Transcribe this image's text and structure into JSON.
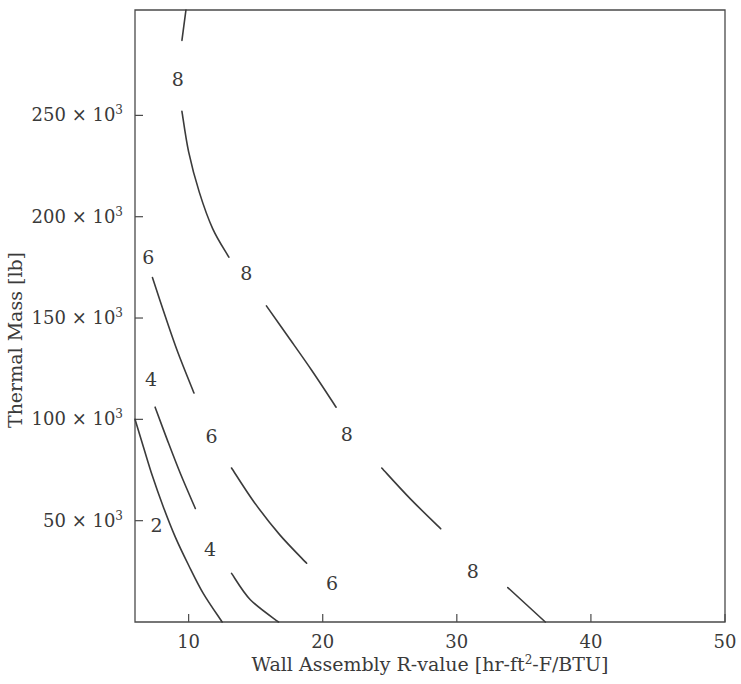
{
  "chart_data": {
    "type": "line",
    "title": "",
    "subtitle": "",
    "xlabel_parts": {
      "main": "Wall Assembly R-value [hr-ft",
      "sup": "2",
      "tail": "-F/BTU]"
    },
    "xlabel": "Wall Assembly R-value [hr-ft2-F/BTU]",
    "ylabel": "Thermal Mass [lb]",
    "xlim": [
      6.0,
      50.0
    ],
    "ylim": [
      0,
      302000
    ],
    "grid": false,
    "legend": "none",
    "xticks": [
      10,
      20,
      30,
      40,
      50
    ],
    "xtick_labels": [
      "10",
      "20",
      "30",
      "40",
      "50"
    ],
    "yticks": [
      50000,
      100000,
      150000,
      200000,
      250000
    ],
    "ytick_labels": [
      {
        "mantissa": "50",
        "times": "×",
        "base": "10",
        "exp": "3"
      },
      {
        "mantissa": "100",
        "times": "×",
        "base": "10",
        "exp": "3"
      },
      {
        "mantissa": "150",
        "times": "×",
        "base": "10",
        "exp": "3"
      },
      {
        "mantissa": "200",
        "times": "×",
        "base": "10",
        "exp": "3"
      },
      {
        "mantissa": "250",
        "times": "×",
        "base": "10",
        "exp": "3"
      }
    ],
    "series": [
      {
        "name": "contour-2",
        "level": 2,
        "label": "2",
        "label_points": [
          {
            "x": 7.6,
            "y": 48000
          }
        ],
        "points": [
          {
            "x": 6.0,
            "y": 100000
          },
          {
            "x": 6.6,
            "y": 87000
          },
          {
            "x": 7.3,
            "y": 72000
          },
          {
            "x": 8.1,
            "y": 57000
          },
          {
            "x": 9.0,
            "y": 42000
          },
          {
            "x": 10.0,
            "y": 28000
          },
          {
            "x": 11.1,
            "y": 14000
          },
          {
            "x": 12.5,
            "y": 0
          }
        ]
      },
      {
        "name": "contour-4",
        "level": 4,
        "label": "4",
        "label_points": [
          {
            "x": 7.2,
            "y": 120000
          },
          {
            "x": 11.6,
            "y": 36000
          }
        ],
        "points": [
          {
            "x": 6.0,
            "y": 137000
          },
          {
            "x": 6.7,
            "y": 122000
          },
          {
            "x": 7.5,
            "y": 106000
          },
          {
            "x": 8.4,
            "y": 90000
          },
          {
            "x": 9.4,
            "y": 73000
          },
          {
            "x": 10.5,
            "y": 56000
          },
          {
            "x": 11.7,
            "y": 40000
          },
          {
            "x": 13.2,
            "y": 24000
          },
          {
            "x": 14.6,
            "y": 11000
          },
          {
            "x": 16.7,
            "y": 0
          }
        ]
      },
      {
        "name": "contour-6",
        "level": 6,
        "label": "6",
        "label_points": [
          {
            "x": 7.0,
            "y": 180000
          },
          {
            "x": 11.7,
            "y": 92000
          },
          {
            "x": 20.7,
            "y": 19000
          }
        ],
        "points": [
          {
            "x": 6.0,
            "y": 200000
          },
          {
            "x": 6.6,
            "y": 186000
          },
          {
            "x": 7.3,
            "y": 170000
          },
          {
            "x": 8.2,
            "y": 152000
          },
          {
            "x": 9.2,
            "y": 133000
          },
          {
            "x": 10.4,
            "y": 113000
          },
          {
            "x": 11.7,
            "y": 94000
          },
          {
            "x": 13.2,
            "y": 76000
          },
          {
            "x": 14.9,
            "y": 59000
          },
          {
            "x": 16.8,
            "y": 43000
          },
          {
            "x": 18.8,
            "y": 29000
          },
          {
            "x": 21.0,
            "y": 15000
          },
          {
            "x": 23.4,
            "y": 0
          }
        ]
      },
      {
        "name": "contour-8",
        "level": 8,
        "label": "8",
        "label_points": [
          {
            "x": 9.2,
            "y": 268000
          },
          {
            "x": 14.3,
            "y": 172000
          },
          {
            "x": 21.8,
            "y": 93000
          },
          {
            "x": 31.2,
            "y": 25000
          }
        ],
        "points": [
          {
            "x": 9.8,
            "y": 302000
          },
          {
            "x": 9.5,
            "y": 287000
          },
          {
            "x": 9.3,
            "y": 270000
          },
          {
            "x": 9.5,
            "y": 252000
          },
          {
            "x": 10.0,
            "y": 232000
          },
          {
            "x": 10.8,
            "y": 212000
          },
          {
            "x": 11.8,
            "y": 194000
          },
          {
            "x": 13.0,
            "y": 180000
          },
          {
            "x": 14.3,
            "y": 169000
          },
          {
            "x": 15.8,
            "y": 156000
          },
          {
            "x": 17.4,
            "y": 141000
          },
          {
            "x": 19.2,
            "y": 124000
          },
          {
            "x": 21.0,
            "y": 106000
          },
          {
            "x": 22.6,
            "y": 90000
          },
          {
            "x": 24.4,
            "y": 76000
          },
          {
            "x": 26.5,
            "y": 61000
          },
          {
            "x": 28.8,
            "y": 46000
          },
          {
            "x": 31.3,
            "y": 32000
          },
          {
            "x": 33.8,
            "y": 17000
          },
          {
            "x": 36.6,
            "y": 0
          }
        ]
      }
    ]
  }
}
